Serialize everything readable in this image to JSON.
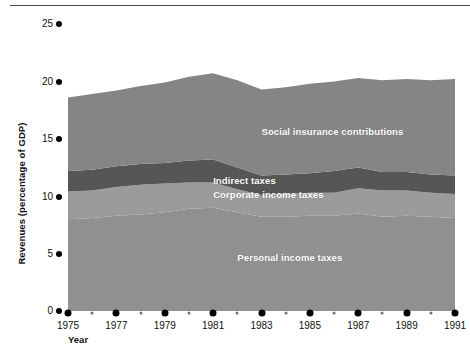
{
  "chart_data": {
    "type": "area",
    "title": "",
    "subtitle": "",
    "xlabel": "Year",
    "ylabel": "Revenues (percentage of GDP)",
    "stacked": true,
    "grid": false,
    "legend_position": "inline-labels",
    "xlim": [
      1975,
      1992
    ],
    "ylim": [
      0,
      25
    ],
    "yticks": [
      0,
      5,
      10,
      15,
      20,
      25
    ],
    "ytick_labels": [
      "0",
      "5",
      "10",
      "15",
      "20",
      "25"
    ],
    "xticks_major": [
      1975,
      1977,
      1979,
      1981,
      1983,
      1985,
      1987,
      1989,
      1991
    ],
    "xtick_labels": [
      "1975",
      "1977",
      "1979",
      "1981",
      "1983",
      "1985",
      "1987",
      "1989",
      "1991"
    ],
    "xticks_minor": [
      1976,
      1978,
      1980,
      1982,
      1984,
      1986,
      1988,
      1990,
      1992
    ],
    "x": [
      1975,
      1976,
      1977,
      1978,
      1979,
      1980,
      1981,
      1982,
      1983,
      1984,
      1985,
      1986,
      1987,
      1988,
      1989,
      1990,
      1991
    ],
    "series": [
      {
        "name": "Personal income taxes",
        "color": "#909090",
        "values": [
          8.0,
          8.1,
          8.3,
          8.4,
          8.6,
          8.9,
          9.0,
          8.6,
          8.2,
          8.2,
          8.3,
          8.3,
          8.5,
          8.2,
          8.3,
          8.2,
          8.1
        ]
      },
      {
        "name": "Corporate income taxes",
        "color": "#9b9b9b",
        "values": [
          2.4,
          2.4,
          2.5,
          2.6,
          2.5,
          2.3,
          2.2,
          2.0,
          1.9,
          2.0,
          2.0,
          2.0,
          2.2,
          2.3,
          2.2,
          2.1,
          2.1
        ]
      },
      {
        "name": "Indirect taxes",
        "color": "#565656",
        "values": [
          1.8,
          1.8,
          1.8,
          1.8,
          1.8,
          1.9,
          2.0,
          1.9,
          1.7,
          1.7,
          1.7,
          1.9,
          1.8,
          1.6,
          1.6,
          1.6,
          1.6
        ]
      },
      {
        "name": "Social insurance contributions",
        "color": "#858585",
        "values": [
          6.4,
          6.6,
          6.6,
          6.8,
          7.0,
          7.3,
          7.5,
          7.6,
          7.5,
          7.6,
          7.8,
          7.8,
          7.8,
          8.0,
          8.1,
          8.2,
          8.4
        ]
      }
    ],
    "totals": [
      18.6,
      18.9,
      19.2,
      19.6,
      19.9,
      20.4,
      20.7,
      20.1,
      19.3,
      19.5,
      19.8,
      20.0,
      20.3,
      20.1,
      20.2,
      20.1,
      20.2
    ],
    "annotations": [
      {
        "text": "Social insurance contributions",
        "x": 1983,
        "y": 15.6
      },
      {
        "text": "Indirect taxes",
        "x": 1981,
        "y": 11.3
      },
      {
        "text": "Corporate income taxes",
        "x": 1981,
        "y": 10.1
      },
      {
        "text": "Personal income taxes",
        "x": 1982,
        "y": 4.6
      }
    ]
  },
  "axes": {
    "y_label": "Revenues (percentage of GDP)",
    "x_label": "Year"
  }
}
